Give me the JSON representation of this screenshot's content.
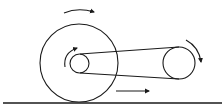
{
  "diagram": {
    "stroke_color": "#1a1a1a",
    "background": "#ffffff",
    "elements": {
      "large_wheel": {
        "cx": 79,
        "cy": 63,
        "r": 39
      },
      "small_pulley": {
        "cx": 79.5,
        "cy": 63.5,
        "r": 9.5
      },
      "right_pulley": {
        "cx": 179,
        "cy": 63,
        "r": 16
      },
      "ground_line": {
        "y": 103
      },
      "arrows": [
        {
          "name": "large-wheel-rotation",
          "direction": "clockwise"
        },
        {
          "name": "small-pulley-rotation",
          "direction": "clockwise"
        },
        {
          "name": "right-pulley-rotation",
          "direction": "clockwise"
        },
        {
          "name": "translation",
          "direction": "right"
        }
      ]
    }
  }
}
